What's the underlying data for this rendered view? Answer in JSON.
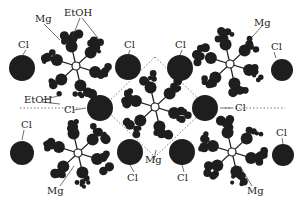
{
  "figure": {
    "type": "crystal-structure",
    "colors": {
      "atom": "#1e1e1e",
      "background": "#ffffff",
      "cell_line": "#555555"
    },
    "chlorides": [
      {
        "x": 22,
        "y": 68,
        "r": 13
      },
      {
        "x": 128,
        "y": 67,
        "r": 13
      },
      {
        "x": 180,
        "y": 68,
        "r": 13
      },
      {
        "x": 282,
        "y": 70,
        "r": 11
      },
      {
        "x": 100,
        "y": 108,
        "r": 13
      },
      {
        "x": 205,
        "y": 108,
        "r": 13
      },
      {
        "x": 22,
        "y": 153,
        "r": 12
      },
      {
        "x": 130,
        "y": 152,
        "r": 13
      },
      {
        "x": 182,
        "y": 152,
        "r": 13
      },
      {
        "x": 283,
        "y": 155,
        "r": 11
      }
    ],
    "complexes": [
      {
        "x": 76,
        "y": 66
      },
      {
        "x": 230,
        "y": 64
      },
      {
        "x": 155,
        "y": 107
      },
      {
        "x": 78,
        "y": 153
      },
      {
        "x": 232,
        "y": 152
      }
    ]
  },
  "labels": [
    {
      "id": "mg-top-left",
      "text": "Mg",
      "x": 35,
      "y": 14
    },
    {
      "id": "etoh-top",
      "text": "EtOH",
      "x": 64,
      "y": 8
    },
    {
      "id": "cl-top-1",
      "text": "Cl",
      "x": 18,
      "y": 40
    },
    {
      "id": "cl-top-2",
      "text": "Cl",
      "x": 124,
      "y": 40
    },
    {
      "id": "cl-top-3",
      "text": "Cl",
      "x": 175,
      "y": 40
    },
    {
      "id": "mg-top-right",
      "text": "Mg",
      "x": 254,
      "y": 18
    },
    {
      "id": "cl-top-4",
      "text": "Cl",
      "x": 271,
      "y": 42
    },
    {
      "id": "etoh-left",
      "text": "EtOH",
      "x": 24,
      "y": 95
    },
    {
      "id": "cl-mid-left",
      "text": "Cl",
      "x": 64,
      "y": 105
    },
    {
      "id": "cl-mid-right",
      "text": "Cl",
      "x": 235,
      "y": 103
    },
    {
      "id": "cl-bottom-1",
      "text": "Cl",
      "x": 21,
      "y": 120
    },
    {
      "id": "cl-bottom-4",
      "text": "Cl",
      "x": 276,
      "y": 128
    },
    {
      "id": "mg-bottom-left",
      "text": "Mg",
      "x": 47,
      "y": 186
    },
    {
      "id": "cl-bottom-2",
      "text": "Cl",
      "x": 127,
      "y": 173
    },
    {
      "id": "mg-bottom-mid",
      "text": "Mg",
      "x": 145,
      "y": 155
    },
    {
      "id": "cl-bottom-3",
      "text": "Cl",
      "x": 177,
      "y": 173
    },
    {
      "id": "mg-bottom-right",
      "text": "Mg",
      "x": 247,
      "y": 186
    }
  ]
}
